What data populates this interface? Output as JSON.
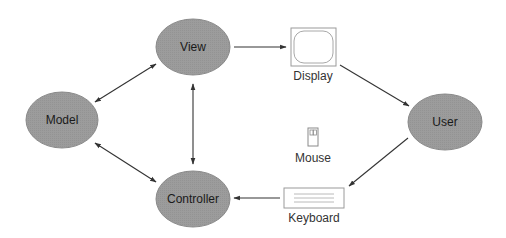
{
  "diagram": {
    "colors": {
      "node_fill": "#9a9a9a",
      "node_stroke": "#8a8a8a",
      "edge": "#333333",
      "device_stroke": "#9a9a9a"
    },
    "nodes": [
      {
        "id": "view",
        "label": "View"
      },
      {
        "id": "model",
        "label": "Model"
      },
      {
        "id": "controller",
        "label": "Controller"
      },
      {
        "id": "user",
        "label": "User"
      }
    ],
    "devices": [
      {
        "id": "display",
        "label": "Display",
        "icon": "monitor-icon"
      },
      {
        "id": "mouse",
        "label": "Mouse",
        "icon": "mouse-icon"
      },
      {
        "id": "keyboard",
        "label": "Keyboard",
        "icon": "keyboard-icon"
      }
    ],
    "edges": [
      {
        "from": "model",
        "to": "view",
        "type": "bidirectional"
      },
      {
        "from": "model",
        "to": "controller",
        "type": "bidirectional"
      },
      {
        "from": "view",
        "to": "controller",
        "type": "bidirectional"
      },
      {
        "from": "view",
        "to": "display",
        "type": "directed"
      },
      {
        "from": "display",
        "to": "user",
        "type": "directed"
      },
      {
        "from": "user",
        "to": "keyboard",
        "type": "directed"
      },
      {
        "from": "keyboard",
        "to": "controller",
        "type": "directed"
      }
    ]
  }
}
